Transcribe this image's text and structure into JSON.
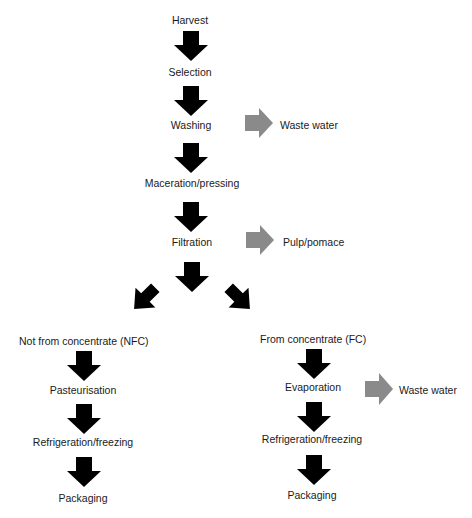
{
  "diagram": {
    "type": "process-flowchart",
    "colors": {
      "main_arrow": "#000000",
      "side_arrow": "#8a8a8a",
      "text": "#1a1a1a",
      "background": "#ffffff"
    },
    "main_steps": {
      "harvest": "Harvest",
      "selection": "Selection",
      "washing": "Washing",
      "maceration": "Maceration/pressing",
      "filtration": "Filtration"
    },
    "side_outputs": {
      "washing_waste": "Waste water",
      "filtration_waste": "Pulp/pomace",
      "evaporation_waste": "Waste water"
    },
    "nfc_branch": {
      "title": "Not from concentrate (NFC)",
      "steps": [
        "Pasteurisation",
        "Refrigeration/freezing",
        "Packaging"
      ]
    },
    "fc_branch": {
      "title": "From concentrate (FC)",
      "steps": [
        "Evaporation",
        "Refrigeration/freezing",
        "Packaging"
      ]
    }
  }
}
